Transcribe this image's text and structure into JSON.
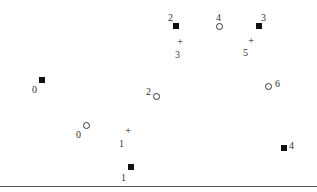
{
  "diagram": {
    "type": "scatter-embedding",
    "legend": [],
    "marker_types": {
      "square": "filled-square",
      "circle": "open-circle",
      "plus": "plus"
    },
    "points": [
      {
        "marker": "square",
        "label": "2",
        "x": 176,
        "y": 26,
        "lx": 168,
        "ly": 13
      },
      {
        "marker": "circle",
        "label": "4",
        "x": 219,
        "y": 26,
        "lx": 216,
        "ly": 13
      },
      {
        "marker": "square",
        "label": "3",
        "x": 259,
        "y": 26,
        "lx": 261,
        "ly": 13
      },
      {
        "marker": "plus",
        "label": "3",
        "x": 180,
        "y": 42,
        "lx": 175,
        "ly": 50
      },
      {
        "marker": "plus",
        "label": "5",
        "x": 251,
        "y": 41,
        "lx": 243,
        "ly": 48
      },
      {
        "marker": "square",
        "label": "0",
        "x": 42,
        "y": 80,
        "lx": 32,
        "ly": 85
      },
      {
        "marker": "circle",
        "label": "2",
        "x": 156,
        "y": 96,
        "lx": 146,
        "ly": 87
      },
      {
        "marker": "circle",
        "label": "6",
        "x": 268,
        "y": 86,
        "lx": 275,
        "ly": 79
      },
      {
        "marker": "circle",
        "label": "0",
        "x": 86,
        "y": 125,
        "lx": 76,
        "ly": 130
      },
      {
        "marker": "plus",
        "label": "1",
        "x": 128,
        "y": 131,
        "lx": 119,
        "ly": 139
      },
      {
        "marker": "square",
        "label": "4",
        "x": 284,
        "y": 148,
        "lx": 289,
        "ly": 141
      },
      {
        "marker": "square",
        "label": "1",
        "x": 131,
        "y": 167,
        "lx": 121,
        "ly": 173
      }
    ],
    "colors": {
      "marker": "#111111",
      "label": "#333333",
      "axis_line": "#555555",
      "background": "#ffffff"
    }
  }
}
